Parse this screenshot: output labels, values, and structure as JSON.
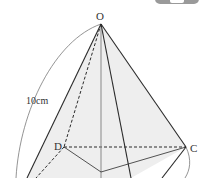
{
  "diagram": {
    "vertices": {
      "apex": "O",
      "back_left": "D",
      "right": "C"
    },
    "measure": {
      "label": "10cm",
      "value": 10,
      "unit": "cm"
    },
    "colors": {
      "line": "#2a2a2a",
      "face_fill": "#ececec",
      "arc": "#555555"
    }
  }
}
